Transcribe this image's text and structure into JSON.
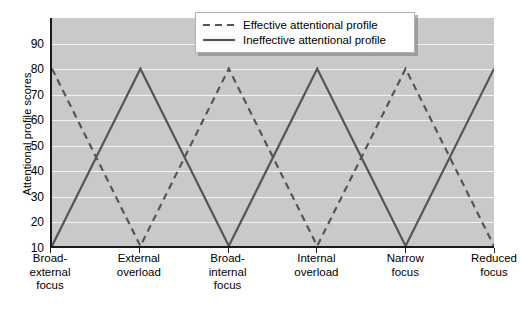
{
  "chart_data": {
    "type": "line",
    "title": "",
    "xlabel": "",
    "ylabel": "Attentional profile scores",
    "categories": [
      "Broad-\nexternal\nfocus",
      "External\noverload",
      "Broad-\ninternal\nfocus",
      "Internal\noverload",
      "Narrow\nfocus",
      "Reduced\nfocus"
    ],
    "ylim": [
      10,
      100
    ],
    "yticks": [
      90,
      80,
      70,
      60,
      50,
      40,
      30,
      20,
      10
    ],
    "grid": true,
    "legend_position": "top-center",
    "series": [
      {
        "name": "Effective attentional profile",
        "style": "dashed",
        "color": "#555555",
        "values": [
          80,
          10,
          80,
          10,
          80,
          10
        ]
      },
      {
        "name": "Ineffective attentional profile",
        "style": "solid",
        "color": "#555555",
        "values": [
          10,
          80,
          10,
          80,
          10,
          80
        ]
      }
    ]
  },
  "axis": {
    "y_title": "Attentional profile scores",
    "y_tick_labels": [
      "90",
      "80",
      "70",
      "60",
      "50",
      "40",
      "30",
      "20",
      "10"
    ],
    "x_tick_labels": [
      [
        "Broad-",
        "external",
        "focus"
      ],
      [
        "External",
        "overload"
      ],
      [
        "Broad-",
        "internal",
        "focus"
      ],
      [
        "Internal",
        "overload"
      ],
      [
        "Narrow",
        "focus"
      ],
      [
        "Reduced",
        "focus"
      ]
    ]
  },
  "legend": {
    "entries": [
      {
        "label": "Effective attentional profile",
        "style": "dashed"
      },
      {
        "label": "Ineffective attentional profile",
        "style": "solid"
      }
    ]
  },
  "caption": {
    "text": ""
  },
  "colors": {
    "plot_background": "#c9c9c9",
    "gridline": "#f2f2f2",
    "axis": "#1a1a1a",
    "series_line": "#555555",
    "legend_background": "#ffffff"
  }
}
